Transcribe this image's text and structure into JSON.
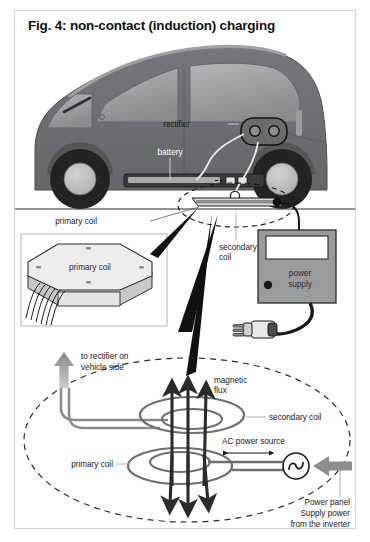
{
  "figure": {
    "title": "Fig. 4: non-contact (induction) charging",
    "border_color": "#d2d2d2",
    "background": "#ffffff"
  },
  "colors": {
    "car_body": "#6f7072",
    "car_body_dark": "#575859",
    "window_glass": "#9a9b9d",
    "tire": "#232323",
    "hub": "#b9babc",
    "coil_gray": "#8a8b8d",
    "flux_arrow": "#2b2b2b",
    "gray_arrow": "#8d8e90",
    "pad_face": "#e8e8e8",
    "pad_side": "#bfc0c1",
    "power_supply_box": "#9a9b9d",
    "leader_line": "#9a9a9a",
    "text": "#1a1a1a"
  },
  "labels": {
    "rectifier": "rectifier",
    "battery": "battery",
    "primary_coil_top": "primary coil",
    "secondary_coil_top_line1": "secondary",
    "secondary_coil_top_line2": "coil",
    "power_supply_line1": "power",
    "power_supply_line2": "supply",
    "inset_primary_coil": "primary coil",
    "to_rectifier_line1": "to rectifier on",
    "to_rectifier_line2": "vehicle side",
    "magnetic_flux_line1": "magnetic",
    "magnetic_flux_line2": "flux",
    "secondary_coil_bottom": "secondary coil",
    "primary_coil_bottom": "primary coil",
    "ac_power_source": "AC power source",
    "power_panel_line1": "Power panel",
    "power_panel_line2": "Supply power",
    "power_panel_line3": "from the inverter"
  },
  "diagram": {
    "type": "technical-illustration",
    "sections": [
      "vehicle-side-view-with-rectifier-battery-and-secondary-coil",
      "ground-line",
      "primary-coil-pad-inset-detail",
      "power-supply-unit-with-mains-plug",
      "induction-coupling-schematic-with-magnetic-flux"
    ]
  }
}
